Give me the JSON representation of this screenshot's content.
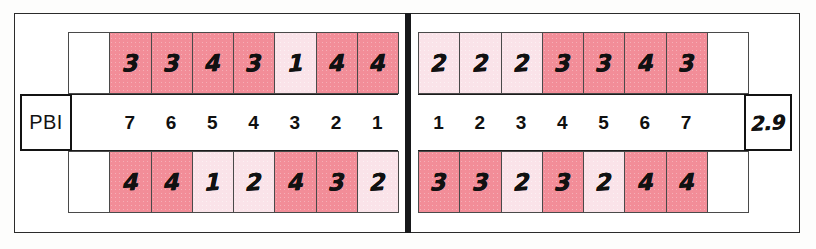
{
  "form": {
    "label": "PBI",
    "score": "2.9",
    "colors": {
      "shade_dark": "#f28d98",
      "shade_light": "#fae3e9",
      "frame": "#2b2b2b",
      "divider": "#17181a",
      "text": "#111111"
    }
  },
  "chart_data": {
    "type": "table",
    "title": "PBI",
    "xlabel": "",
    "ylabel": "",
    "annotations": [
      "PBI",
      "2.9"
    ],
    "legend": [
      {
        "label": "dark pink",
        "meaning": "rating 3 or 4",
        "color": "#f28d98"
      },
      {
        "label": "light pink",
        "meaning": "rating 1 or 2",
        "color": "#fae3e9"
      }
    ],
    "left_block": {
      "scale_labels": [
        "7",
        "6",
        "5",
        "4",
        "3",
        "2",
        "1"
      ],
      "top_values": [
        "3",
        "3",
        "4",
        "3",
        "1",
        "4",
        "4"
      ],
      "bottom_values": [
        "4",
        "4",
        "1",
        "2",
        "4",
        "3",
        "2"
      ],
      "top_shades": [
        "dark",
        "dark",
        "dark",
        "dark",
        "light",
        "dark",
        "dark"
      ],
      "bottom_shades": [
        "dark",
        "dark",
        "light",
        "light",
        "dark",
        "dark",
        "light"
      ]
    },
    "right_block": {
      "scale_labels": [
        "1",
        "2",
        "3",
        "4",
        "5",
        "6",
        "7"
      ],
      "top_values": [
        "2",
        "2",
        "2",
        "3",
        "3",
        "4",
        "3"
      ],
      "bottom_values": [
        "3",
        "3",
        "2",
        "3",
        "2",
        "4",
        "4"
      ],
      "top_shades": [
        "light",
        "light",
        "light",
        "dark",
        "dark",
        "dark",
        "dark"
      ],
      "bottom_shades": [
        "dark",
        "dark",
        "light",
        "dark",
        "light",
        "dark",
        "dark"
      ]
    }
  }
}
